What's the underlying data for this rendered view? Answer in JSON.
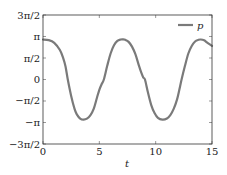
{
  "chart_data": {
    "type": "line",
    "title": "",
    "xlabel": "t",
    "ylabel": "",
    "xlim": [
      0,
      15
    ],
    "ylim": [
      -4.712389,
      4.712389
    ],
    "grid": false,
    "legend_position": "upper right",
    "x_ticks": [
      {
        "value": 0,
        "label": "0"
      },
      {
        "value": 5,
        "label": "5"
      },
      {
        "value": 10,
        "label": "10"
      },
      {
        "value": 15,
        "label": "15"
      }
    ],
    "y_ticks": [
      {
        "value": 4.712389,
        "label": "3π/2"
      },
      {
        "value": 3.141593,
        "label": "π"
      },
      {
        "value": 1.570796,
        "label": "π/2"
      },
      {
        "value": 0,
        "label": "0"
      },
      {
        "value": -1.570796,
        "label": "−π/2"
      },
      {
        "value": -3.141593,
        "label": "−π"
      },
      {
        "value": -4.712389,
        "label": "−3π/2"
      }
    ],
    "series": [
      {
        "name": "p",
        "color": "#7a7a7a",
        "x": [
          0,
          0.5,
          1.0,
          1.5,
          1.8,
          2.0,
          2.2,
          2.5,
          2.8,
          3.0,
          3.3,
          3.6,
          3.9,
          4.2,
          4.5,
          4.8,
          5.0,
          5.2,
          5.4,
          5.7,
          6.0,
          6.3,
          6.6,
          6.9,
          7.1,
          7.3,
          7.6,
          7.9,
          8.2,
          8.5,
          8.7,
          8.9,
          9.05,
          9.3,
          9.6,
          9.9,
          10.2,
          10.6,
          11.0,
          11.3,
          11.6,
          11.9,
          12.1,
          12.3,
          12.6,
          12.9,
          13.2,
          13.5,
          13.8,
          14.0,
          14.3,
          14.6,
          15.0
        ],
        "values": [
          2.92,
          2.88,
          2.68,
          2.15,
          1.55,
          0.95,
          0.0,
          -1.2,
          -2.15,
          -2.55,
          -2.85,
          -2.93,
          -2.86,
          -2.62,
          -2.15,
          -1.3,
          -0.75,
          -0.35,
          0.0,
          1.0,
          1.9,
          2.5,
          2.82,
          2.92,
          2.93,
          2.9,
          2.75,
          2.4,
          1.85,
          1.05,
          0.55,
          0.15,
          0.0,
          -0.9,
          -1.85,
          -2.45,
          -2.8,
          -2.93,
          -2.85,
          -2.6,
          -2.15,
          -1.45,
          -0.75,
          0.0,
          1.0,
          1.9,
          2.45,
          2.78,
          2.9,
          2.92,
          2.86,
          2.68,
          2.45
        ]
      }
    ]
  }
}
